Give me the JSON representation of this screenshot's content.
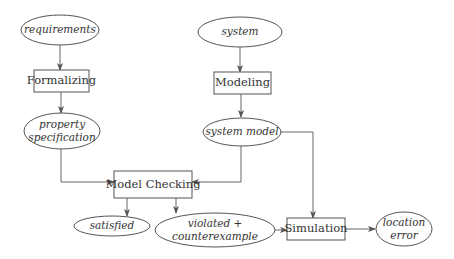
{
  "diagram": {
    "type": "flowchart",
    "nodes": {
      "requirements": {
        "label": "requirements",
        "shape": "ellipse"
      },
      "formalizing": {
        "label": "Formalizing",
        "shape": "box"
      },
      "property_spec": {
        "label_line1": "property",
        "label_line2": "specification",
        "shape": "ellipse"
      },
      "system": {
        "label": "system",
        "shape": "ellipse"
      },
      "modeling": {
        "label": "Modeling",
        "shape": "box"
      },
      "system_model": {
        "label": "system model",
        "shape": "ellipse"
      },
      "model_checking": {
        "label": "Model Checking",
        "shape": "box"
      },
      "satisfied": {
        "label": "satisfied",
        "shape": "ellipse"
      },
      "violated": {
        "label_line1": "violated +",
        "label_line2": "counterexample",
        "shape": "ellipse"
      },
      "simulation": {
        "label": "Simulation",
        "shape": "box"
      },
      "location_error": {
        "label_line1": "location",
        "label_line2": "error",
        "shape": "ellipse"
      }
    },
    "edges": [
      {
        "from": "requirements",
        "to": "formalizing"
      },
      {
        "from": "formalizing",
        "to": "property_spec"
      },
      {
        "from": "property_spec",
        "to": "model_checking"
      },
      {
        "from": "system",
        "to": "modeling"
      },
      {
        "from": "modeling",
        "to": "system_model"
      },
      {
        "from": "system_model",
        "to": "model_checking"
      },
      {
        "from": "system_model",
        "to": "simulation"
      },
      {
        "from": "model_checking",
        "to": "satisfied"
      },
      {
        "from": "model_checking",
        "to": "violated"
      },
      {
        "from": "violated",
        "to": "simulation"
      },
      {
        "from": "simulation",
        "to": "location_error"
      }
    ]
  }
}
